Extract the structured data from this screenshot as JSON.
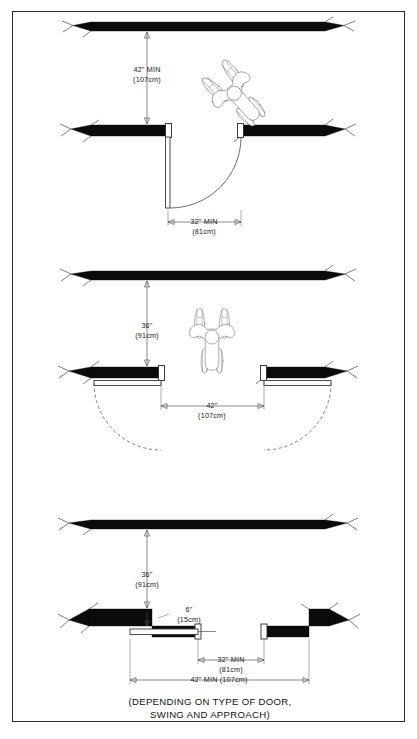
{
  "sheet": {
    "background_color": "#ffffff",
    "border_color": "#2b2b2b",
    "ink_color": "#0b0b0b"
  },
  "caption": {
    "line1": "(DEPENDING ON TYPE OF DOOR,",
    "line2": "SWING AND APPROACH)"
  },
  "diagrams": [
    {
      "id": "front-approach-single-door",
      "title_hidden": "Single door, front approach",
      "dimensions": [
        {
          "name": "clear-depth",
          "value": "42\" MIN",
          "metric": "(107cm)",
          "orientation": "vertical"
        },
        {
          "name": "clear-door-width",
          "value": "32\" MIN",
          "metric": "(81cm)",
          "orientation": "horizontal"
        }
      ],
      "figure": "wheelchair-top-view-angled"
    },
    {
      "id": "double-door-out-swing",
      "title_hidden": "Pair of doors swinging out",
      "dimensions": [
        {
          "name": "clear-depth",
          "value": "36\"",
          "metric": "(91cm)",
          "orientation": "vertical"
        },
        {
          "name": "clear-opening-width",
          "value": "42\"",
          "metric": "(107cm)",
          "orientation": "horizontal"
        }
      ],
      "figure": "wheelchair-top-view-upright"
    },
    {
      "id": "recessed-door-latch-approach",
      "title_hidden": "Recessed door, latch side approach",
      "dimensions": [
        {
          "name": "clear-depth",
          "value": "36\"",
          "metric": "(91cm)",
          "orientation": "vertical"
        },
        {
          "name": "latch-side-clearance",
          "value": "6\"",
          "metric": "(15cm)",
          "orientation": "callout"
        },
        {
          "name": "clear-door-width",
          "value": "32\" MIN",
          "metric": "(81cm)",
          "orientation": "horizontal"
        },
        {
          "name": "overall-recess-width",
          "value": "42\" MIN (107cm)",
          "metric": "",
          "orientation": "horizontal"
        }
      ],
      "figure": "none"
    }
  ],
  "labels": {
    "d1_v_line1": "42\" MIN",
    "d1_v_line2": "(107cm)",
    "d1_h_line1": "32\" MIN",
    "d1_h_line2": "(81cm)",
    "d2_v_line1": "36\"",
    "d2_v_line2": "(91cm)",
    "d2_h_line1": "42\"",
    "d2_h_line2": "(107cm)",
    "d3_v_line1": "36\"",
    "d3_v_line2": "(91cm)",
    "d3_c_line1": "6\"",
    "d3_c_line2": "(15cm)",
    "d3_h_line1": "32\" MIN",
    "d3_h_line2": "(81cm)",
    "d3_total": "42\" MIN (107cm)"
  }
}
